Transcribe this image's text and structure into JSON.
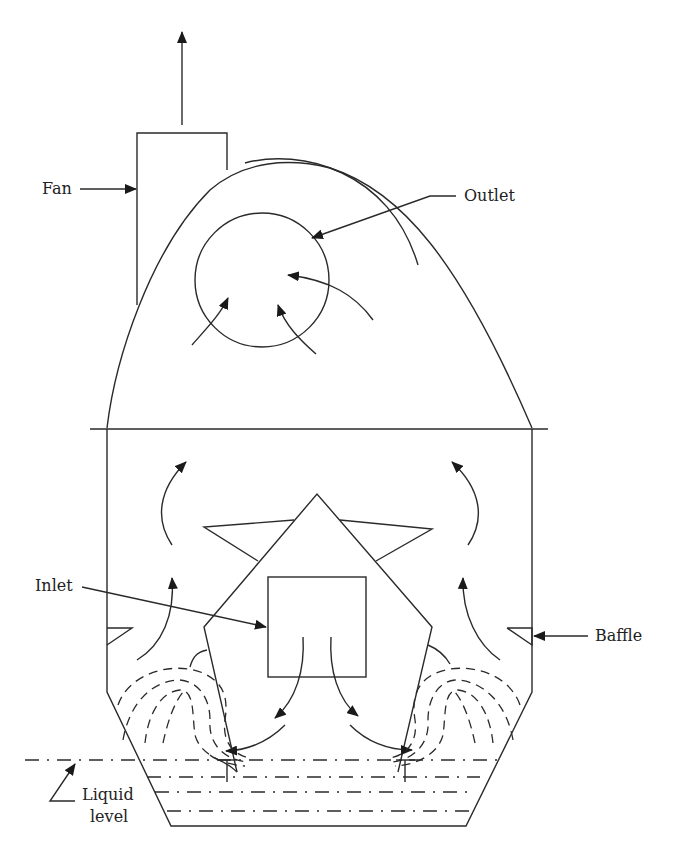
{
  "diagram": {
    "type": "wet scrubber schematic",
    "labels": {
      "fan": "Fan",
      "outlet": "Outlet",
      "inlet": "Inlet",
      "baffle": "Baffle",
      "liquid_level_line1": "Liquid",
      "liquid_level_line2": "level"
    },
    "colors": {
      "line": "#2a2a2a",
      "background": "#ffffff",
      "text": "#222222"
    }
  }
}
